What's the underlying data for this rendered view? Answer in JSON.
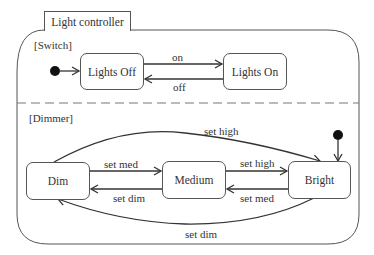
{
  "diagram": {
    "type": "UML state machine",
    "title": "Light controller",
    "regions": [
      {
        "name": "[Switch]",
        "initial_state": "Lights Off",
        "states": [
          "Lights Off",
          "Lights On"
        ],
        "transitions": [
          {
            "from": "Lights Off",
            "to": "Lights On",
            "label": "on"
          },
          {
            "from": "Lights On",
            "to": "Lights Off",
            "label": "off"
          }
        ]
      },
      {
        "name": "[Dimmer]",
        "initial_state": "Bright",
        "states": [
          "Dim",
          "Medium",
          "Bright"
        ],
        "transitions": [
          {
            "from": "Dim",
            "to": "Medium",
            "label": "set med"
          },
          {
            "from": "Medium",
            "to": "Dim",
            "label": "set dim"
          },
          {
            "from": "Medium",
            "to": "Bright",
            "label": "set high"
          },
          {
            "from": "Bright",
            "to": "Medium",
            "label": "set med"
          },
          {
            "from": "Dim",
            "to": "Bright",
            "label": "set high"
          },
          {
            "from": "Bright",
            "to": "Dim",
            "label": "set dim"
          }
        ]
      }
    ]
  },
  "labels": {
    "title": "Light controller",
    "switch_region": "[Switch]",
    "dimmer_region": "[Dimmer]",
    "state_lights_off": "Lights Off",
    "state_lights_on": "Lights On",
    "state_dim": "Dim",
    "state_medium": "Medium",
    "state_bright": "Bright",
    "t_on": "on",
    "t_off": "off",
    "t_dim_med": "set med",
    "t_med_dim": "set dim",
    "t_med_high": "set high",
    "t_bright_med": "set med",
    "t_dim_high": "set high",
    "t_bright_dim": "set dim"
  },
  "colors": {
    "line": "#555555",
    "arrow": "#333333",
    "text": "#333333",
    "background": "#ffffff"
  }
}
